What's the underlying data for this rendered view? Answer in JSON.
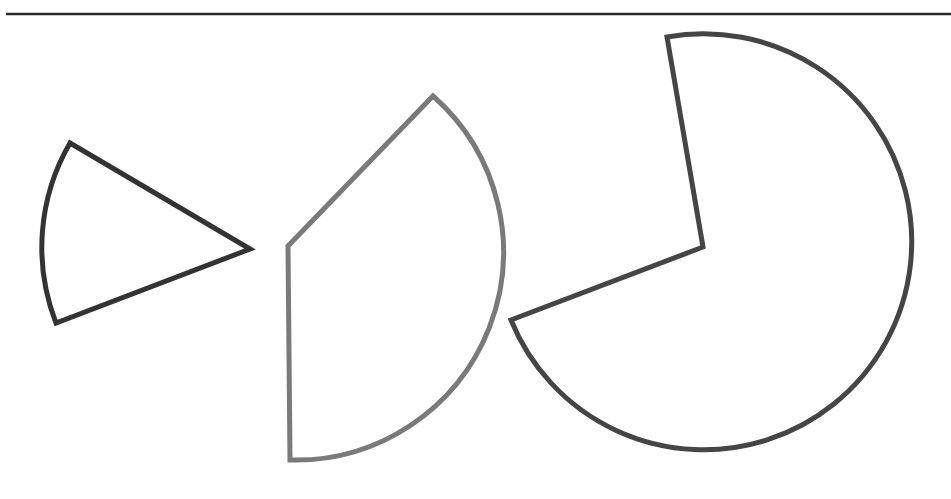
{
  "canvas": {
    "width": 951,
    "height": 499,
    "background": "#ffffff"
  },
  "top_rule": {
    "x1": 6,
    "y1": 14,
    "x2": 951,
    "y2": 14,
    "color": "#2a2a2a",
    "width": 2.5
  },
  "shapes": [
    {
      "id": "sector-small",
      "description": "Narrow circular sector, apex pointing right",
      "center": [
        250,
        249
      ],
      "radius": 208,
      "start": [
        70,
        143
      ],
      "end": [
        56,
        323
      ],
      "large_arc": 0,
      "sweep": 0,
      "stroke": "#333333",
      "stroke_width": 5
    },
    {
      "id": "sector-medium",
      "description": "Circular sector opening to the right, vertex at left",
      "center": [
        288,
        246
      ],
      "radius": 208,
      "start": [
        433,
        96
      ],
      "end": [
        290,
        460
      ],
      "large_arc": 0,
      "sweep": 1,
      "stroke": "#7a7a7a",
      "stroke_width": 5
    },
    {
      "id": "sector-large",
      "description": "Large circular sector (pac-man like) with wedge missing at upper-left",
      "center": [
        703,
        247
      ],
      "radius": 208,
      "start": [
        667,
        37
      ],
      "end": [
        511,
        320
      ],
      "large_arc": 1,
      "sweep": 1,
      "stroke": "#454545",
      "stroke_width": 5
    }
  ]
}
